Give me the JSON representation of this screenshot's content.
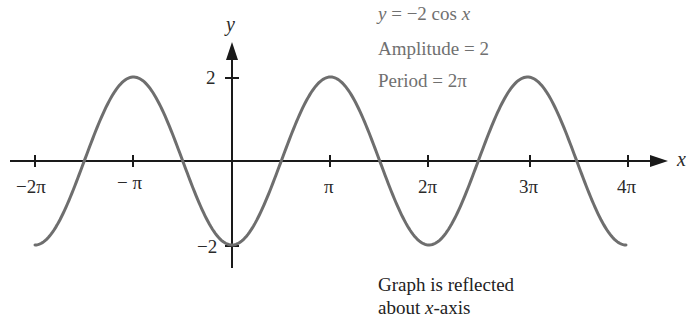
{
  "chart_data": {
    "type": "line",
    "title": "",
    "function": "y = -2 cos x",
    "xlabel": "x",
    "ylabel": "y",
    "xlim": [
      -6.2832,
      12.5664
    ],
    "ylim": [
      -2,
      2
    ],
    "x_ticks": [
      "-2π",
      "-π",
      "π",
      "2π",
      "3π",
      "4π"
    ],
    "y_ticks": [
      "2",
      "-2"
    ],
    "grid": false,
    "series": [
      {
        "name": "y = -2 cos x",
        "x": [
          "-2π",
          "-3π/2",
          "-π",
          "-π/2",
          "0",
          "π/2",
          "π",
          "3π/2",
          "2π",
          "5π/2",
          "3π",
          "7π/2",
          "4π"
        ],
        "values": [
          -2,
          0,
          2,
          0,
          -2,
          0,
          2,
          0,
          -2,
          0,
          2,
          0,
          -2
        ]
      }
    ],
    "annotations": [
      "y = −2 cos x",
      "Amplitude = 2",
      "Period = 2π",
      "Graph is reflected about x-axis"
    ]
  },
  "info": {
    "equation_prefix": "y",
    "equation_rest": " = −2 cos ",
    "equation_var": "x",
    "amplitude": "Amplitude = 2",
    "period": "Period = 2π"
  },
  "note": {
    "line1": "Graph is reflected",
    "line2_prefix": "about ",
    "line2_var": "x",
    "line2_suffix": "-axis"
  },
  "axes": {
    "x_label": "x",
    "y_label": "y",
    "x_ticks": [
      {
        "label": "−2π"
      },
      {
        "label": "− π"
      },
      {
        "label": "π"
      },
      {
        "label": "2π"
      },
      {
        "label": "3π"
      },
      {
        "label": "4π"
      }
    ],
    "y_ticks": [
      {
        "label": "2"
      },
      {
        "label": "−2"
      }
    ]
  },
  "colors": {
    "curve": "#6e6e6e",
    "axis": "#1a1a1a",
    "info_text": "#707070"
  }
}
